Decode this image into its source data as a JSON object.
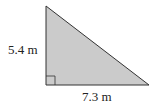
{
  "diagram": {
    "shape": "right-triangle",
    "fill_color": "#cbcbcb",
    "stroke_color": "#333333",
    "vertical_side_label": "5.4 m",
    "horizontal_side_label": "7.3 m",
    "right_angle_marker": true
  }
}
